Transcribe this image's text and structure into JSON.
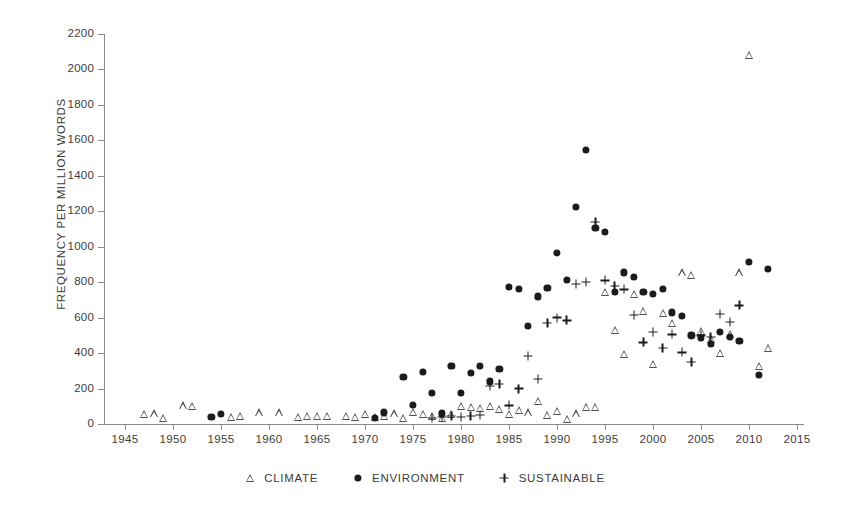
{
  "chart_data": {
    "type": "scatter",
    "title": "",
    "subtitle": "",
    "xlabel": "",
    "ylabel": "FREQUENCY PER MILLION WORDS",
    "xlim": [
      1943,
      2017
    ],
    "ylim": [
      0,
      2300
    ],
    "grid": false,
    "legend_position": "bottom-center",
    "x_ticks": [
      1945,
      1950,
      1955,
      1960,
      1965,
      1970,
      1975,
      1980,
      1985,
      1990,
      1995,
      2000,
      2005,
      2010,
      2015
    ],
    "y_ticks": [
      0,
      200,
      400,
      600,
      800,
      1000,
      1200,
      1400,
      1600,
      1800,
      2000,
      2200
    ],
    "series": [
      {
        "name": "CLIMATE",
        "marker": "triangle-open",
        "color": "#4d4d4d",
        "points": [
          [
            1947,
            55
          ],
          [
            1948,
            60
          ],
          [
            1949,
            35
          ],
          [
            1951,
            105
          ],
          [
            1952,
            100
          ],
          [
            1956,
            40
          ],
          [
            1957,
            45
          ],
          [
            1959,
            65
          ],
          [
            1961,
            65
          ],
          [
            1963,
            40
          ],
          [
            1964,
            45
          ],
          [
            1965,
            45
          ],
          [
            1966,
            45
          ],
          [
            1968,
            45
          ],
          [
            1969,
            40
          ],
          [
            1970,
            55
          ],
          [
            1971,
            40
          ],
          [
            1972,
            45
          ],
          [
            1973,
            60
          ],
          [
            1974,
            35
          ],
          [
            1975,
            70
          ],
          [
            1976,
            55
          ],
          [
            1977,
            45
          ],
          [
            1978,
            35
          ],
          [
            1979,
            55
          ],
          [
            1980,
            100
          ],
          [
            1981,
            95
          ],
          [
            1982,
            90
          ],
          [
            1983,
            100
          ],
          [
            1984,
            85
          ],
          [
            1985,
            55
          ],
          [
            1986,
            80
          ],
          [
            1987,
            65
          ],
          [
            1988,
            130
          ],
          [
            1989,
            50
          ],
          [
            1990,
            75
          ],
          [
            1991,
            30
          ],
          [
            1992,
            60
          ],
          [
            1993,
            95
          ],
          [
            1994,
            95
          ],
          [
            1995,
            745
          ],
          [
            1996,
            530
          ],
          [
            1997,
            395
          ],
          [
            1998,
            735
          ],
          [
            1999,
            640
          ],
          [
            2000,
            340
          ],
          [
            2001,
            625
          ],
          [
            2002,
            570
          ],
          [
            2003,
            855
          ],
          [
            2004,
            840
          ],
          [
            2005,
            525
          ],
          [
            2006,
            480
          ],
          [
            2007,
            400
          ],
          [
            2008,
            510
          ],
          [
            2009,
            855
          ],
          [
            2010,
            2080
          ],
          [
            2011,
            330
          ],
          [
            2012,
            430
          ]
        ]
      },
      {
        "name": "ENVIRONMENT",
        "marker": "circle-filled",
        "color": "#1b1b1b",
        "points": [
          [
            1954,
            40
          ],
          [
            1955,
            55
          ],
          [
            1971,
            35
          ],
          [
            1972,
            65
          ],
          [
            1974,
            265
          ],
          [
            1975,
            110
          ],
          [
            1976,
            295
          ],
          [
            1977,
            175
          ],
          [
            1978,
            60
          ],
          [
            1979,
            330
          ],
          [
            1980,
            175
          ],
          [
            1981,
            290
          ],
          [
            1982,
            330
          ],
          [
            1983,
            240
          ],
          [
            1984,
            310
          ],
          [
            1985,
            775
          ],
          [
            1986,
            760
          ],
          [
            1987,
            555
          ],
          [
            1988,
            720
          ],
          [
            1989,
            770
          ],
          [
            1990,
            965
          ],
          [
            1991,
            815
          ],
          [
            1992,
            1225
          ],
          [
            1993,
            1545
          ],
          [
            1994,
            1105
          ],
          [
            1995,
            1085
          ],
          [
            1996,
            745
          ],
          [
            1997,
            855
          ],
          [
            1998,
            830
          ],
          [
            1999,
            745
          ],
          [
            2000,
            735
          ],
          [
            2001,
            760
          ],
          [
            2002,
            630
          ],
          [
            2003,
            610
          ],
          [
            2004,
            500
          ],
          [
            2005,
            485
          ],
          [
            2006,
            450
          ],
          [
            2007,
            520
          ],
          [
            2008,
            490
          ],
          [
            2009,
            470
          ],
          [
            2010,
            915
          ],
          [
            2011,
            275
          ],
          [
            2012,
            875
          ]
        ]
      },
      {
        "name": "SUSTAINABLE",
        "marker": "plus",
        "color": "#1b1b1b",
        "points": [
          [
            1977,
            35
          ],
          [
            1978,
            40
          ],
          [
            1979,
            45
          ],
          [
            1980,
            40
          ],
          [
            1981,
            45
          ],
          [
            1982,
            50
          ],
          [
            1983,
            215
          ],
          [
            1984,
            225
          ],
          [
            1985,
            105
          ],
          [
            1986,
            200
          ],
          [
            1987,
            385
          ],
          [
            1988,
            255
          ],
          [
            1989,
            570
          ],
          [
            1990,
            600
          ],
          [
            1991,
            585
          ],
          [
            1992,
            790
          ],
          [
            1993,
            800
          ],
          [
            1994,
            1140
          ],
          [
            1995,
            810
          ],
          [
            1996,
            780
          ],
          [
            1997,
            760
          ],
          [
            1998,
            615
          ],
          [
            1999,
            460
          ],
          [
            2000,
            520
          ],
          [
            2001,
            430
          ],
          [
            2002,
            505
          ],
          [
            2003,
            405
          ],
          [
            2004,
            350
          ],
          [
            2005,
            500
          ],
          [
            2006,
            490
          ],
          [
            2007,
            620
          ],
          [
            2008,
            575
          ],
          [
            2009,
            670
          ]
        ]
      }
    ]
  },
  "axes": {
    "y_axis_label": "FREQUENCY PER MILLION WORDS",
    "y_tick_labels": [
      "2200",
      "2000",
      "1800",
      "1600",
      "1400",
      "1200",
      "1000",
      "800",
      "600",
      "400",
      "200",
      "0"
    ],
    "x_tick_labels": [
      "1945",
      "1950",
      "1955",
      "1960",
      "1965",
      "1970",
      "1975",
      "1980",
      "1985",
      "1990",
      "1995",
      "2000",
      "2005",
      "2010",
      "2015"
    ]
  },
  "legend": {
    "entries": [
      {
        "label": "CLIMATE",
        "icon": "triangle-open-icon"
      },
      {
        "label": "ENVIRONMENT",
        "icon": "circle-filled-icon"
      },
      {
        "label": "SUSTAINABLE",
        "icon": "plus-icon"
      }
    ]
  },
  "colors": {
    "axis": "#8a8a8a",
    "text": "#3b3b3b",
    "climate": "#4d4d4d",
    "environment": "#1b1b1b",
    "sustainable": "#1b1b1b",
    "background": "#ffffff"
  }
}
